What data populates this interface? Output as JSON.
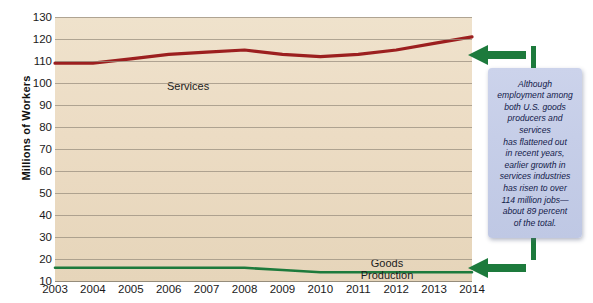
{
  "chart_data": {
    "type": "line",
    "title": "",
    "xlabel": "",
    "ylabel": "Millions of Workers",
    "ylim": [
      10,
      130
    ],
    "ytick_step": 10,
    "yticks": [
      130,
      120,
      110,
      100,
      90,
      80,
      70,
      60,
      50,
      40,
      30,
      20,
      10
    ],
    "grid": true,
    "legend": "inline-labels",
    "categories": [
      2003,
      2004,
      2005,
      2006,
      2007,
      2008,
      2009,
      2010,
      2011,
      2012,
      2013,
      2014
    ],
    "x": [
      "2003",
      "2004",
      "2005",
      "2006",
      "2007",
      "2008",
      "2009",
      "2010",
      "2011",
      "2012",
      "2013",
      "2014"
    ],
    "series": [
      {
        "name": "Services",
        "color": "#9c1f1f",
        "label": "Services",
        "values": [
          109,
          109,
          111,
          113,
          114,
          115,
          113,
          112,
          113,
          115,
          118,
          121
        ]
      },
      {
        "name": "Goods Production",
        "color": "#1d7a3c",
        "label": "Goods\nProduction",
        "label_line1": "Goods",
        "label_line2": "Production",
        "values": [
          16,
          16,
          16,
          16,
          16,
          16,
          15,
          14,
          14,
          14,
          14,
          14
        ]
      }
    ]
  },
  "axis": {
    "y_title": "Millions of Workers"
  },
  "callout": {
    "text": "Although\nemployment among\nboth U.S. goods\nproducers and\nservices\nhas flattened out\nin recent years,\nearlier growth in\nservices industries\nhas risen to over\n114 million jobs—\nabout 89 percent\nof the total.",
    "background": "#c6cee8",
    "text_color": "#13204a"
  },
  "arrows": {
    "top": "left-arrow-icon",
    "bottom": "left-arrow-icon",
    "color": "#1d7a3c"
  },
  "colors": {
    "plot_background": "#ecdcc4",
    "gridline": "#9a8f7f",
    "services": "#9c1f1f",
    "goods": "#1d7a3c"
  }
}
